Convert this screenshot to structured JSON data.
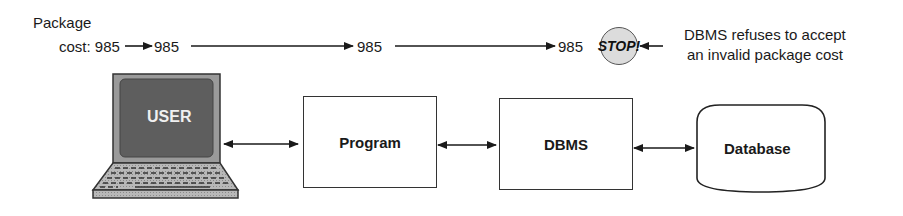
{
  "top_flow": {
    "label_line1": "Package",
    "label_line2": "cost: 985",
    "values": [
      "985",
      "985",
      "985"
    ],
    "stop_badge": "STOP!",
    "note_line1": "DBMS refuses to accept",
    "note_line2": "an invalid package cost"
  },
  "components": {
    "user": "USER",
    "program": "Program",
    "dbms": "DBMS",
    "database": "Database"
  },
  "icons": {
    "laptop": "laptop-icon",
    "stop": "stop-sign-icon",
    "database": "database-cylinder-icon"
  },
  "colors": {
    "screen": "#5e5e5e",
    "bezel": "#9a9a9a",
    "stop_fill": "#dcdcdc",
    "line": "#1a1a1a"
  }
}
